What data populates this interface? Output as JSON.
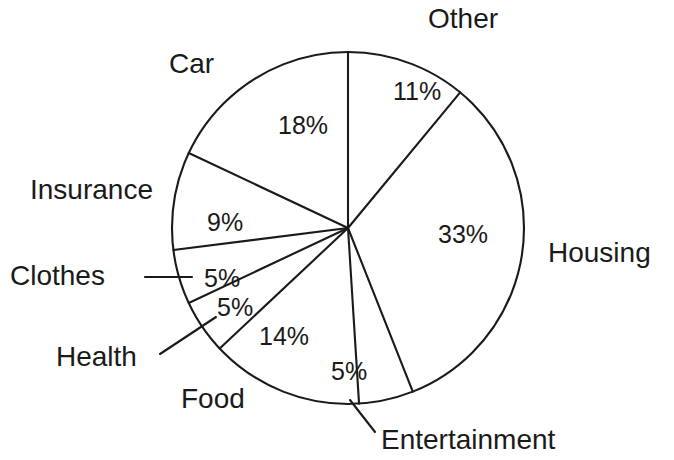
{
  "chart_data": {
    "type": "pie",
    "title": "",
    "subtitle": "",
    "xlabel": "",
    "ylabel": "",
    "legend_position": "none",
    "grid": false,
    "units": "percent",
    "total": 100,
    "start_angle_deg": 0,
    "direction": "clockwise",
    "style": "outline-only, black stroke on white, no fill",
    "categories": [
      "Other",
      "Housing",
      "Entertainment",
      "Food",
      "Health",
      "Clothes",
      "Insurance",
      "Car"
    ],
    "values": [
      11,
      33,
      5,
      14,
      5,
      5,
      9,
      18
    ],
    "slices": [
      {
        "name": "Other",
        "label": "Other",
        "value": 11,
        "value_text": "11%",
        "start_deg": 0,
        "end_deg": 39.6,
        "label_placement": "outside-top",
        "label_x": 428,
        "label_y": 28,
        "pct_x": 393,
        "pct_y": 100,
        "leader": false
      },
      {
        "name": "Housing",
        "label": "Housing",
        "value": 33,
        "value_text": "33%",
        "start_deg": 39.6,
        "end_deg": 158.4,
        "label_placement": "outside-right",
        "label_x": 548,
        "label_y": 262,
        "pct_x": 438,
        "pct_y": 243,
        "leader": false
      },
      {
        "name": "Entertainment",
        "label": "Entertainment",
        "value": 5,
        "value_text": "5%",
        "start_deg": 158.4,
        "end_deg": 176.4,
        "label_placement": "outside-bottom",
        "label_x": 381,
        "label_y": 449,
        "pct_x": 331,
        "pct_y": 380,
        "leader": true,
        "leader_from_x": 350,
        "leader_from_y": 400,
        "leader_to_x": 375,
        "leader_to_y": 432
      },
      {
        "name": "Food",
        "label": "Food",
        "value": 14,
        "value_text": "14%",
        "start_deg": 176.4,
        "end_deg": 226.8,
        "label_placement": "outside-bottom-left",
        "label_x": 181,
        "label_y": 408,
        "pct_x": 259,
        "pct_y": 345,
        "leader": false
      },
      {
        "name": "Health",
        "label": "Health",
        "value": 5,
        "value_text": "5%",
        "start_deg": 226.8,
        "end_deg": 244.8,
        "label_placement": "outside-left",
        "label_x": 56,
        "label_y": 366,
        "pct_x": 217,
        "pct_y": 316,
        "leader": true,
        "leader_from_x": 160,
        "leader_from_y": 354,
        "leader_to_x": 216,
        "leader_to_y": 317
      },
      {
        "name": "Clothes",
        "label": "Clothes",
        "value": 5,
        "value_text": "5%",
        "start_deg": 244.8,
        "end_deg": 262.8,
        "label_placement": "outside-left",
        "label_x": 10,
        "label_y": 285,
        "pct_x": 204,
        "pct_y": 287,
        "leader": true,
        "leader_from_x": 145,
        "leader_from_y": 277,
        "leader_to_x": 192,
        "leader_to_y": 277
      },
      {
        "name": "Insurance",
        "label": "Insurance",
        "value": 9,
        "value_text": "9%",
        "start_deg": 262.8,
        "end_deg": 295.2,
        "label_placement": "outside-left",
        "label_x": 30,
        "label_y": 199,
        "pct_x": 207,
        "pct_y": 231,
        "leader": false
      },
      {
        "name": "Car",
        "label": "Car",
        "value": 18,
        "value_text": "18%",
        "start_deg": 295.2,
        "end_deg": 360,
        "label_placement": "outside-top-left",
        "label_x": 169,
        "label_y": 73,
        "pct_x": 278,
        "pct_y": 134,
        "leader": false
      }
    ],
    "geometry": {
      "center_x": 348,
      "center_y": 228,
      "radius": 176
    }
  }
}
